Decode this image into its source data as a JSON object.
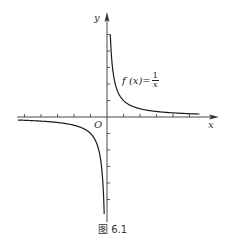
{
  "chart_data": {
    "type": "line",
    "title": "",
    "caption": "图 6.1",
    "function_label": {
      "lhs": "f (x)=",
      "numerator": "1",
      "denominator": "x"
    },
    "xlabel": "x",
    "ylabel": "y",
    "origin_label": "O",
    "xlim": [
      -5.5,
      7.0
    ],
    "ylim": [
      -6.0,
      5.9
    ],
    "grid": false,
    "x_ticks": [
      -5,
      -4,
      -3,
      -2,
      -1,
      1,
      2,
      3,
      4,
      5
    ],
    "y_ticks": [
      -5,
      -4,
      -3,
      -2,
      -1,
      1,
      2,
      3,
      4,
      5
    ],
    "series": [
      {
        "name": "f(x)=1/x (x>0)",
        "x": [
          0.2,
          0.25,
          0.33,
          0.5,
          0.75,
          1,
          1.5,
          2,
          3,
          4,
          5,
          5.6
        ],
        "y": [
          5,
          4,
          3,
          2,
          1.33,
          1,
          0.67,
          0.5,
          0.33,
          0.25,
          0.2,
          0.18
        ]
      },
      {
        "name": "f(x)=1/x (x<0)",
        "x": [
          -5.4,
          -5,
          -4,
          -3,
          -2,
          -1.5,
          -1,
          -0.75,
          -0.5,
          -0.33,
          -0.25,
          -0.2,
          -0.17
        ],
        "y": [
          -0.19,
          -0.2,
          -0.25,
          -0.33,
          -0.5,
          -0.67,
          -1,
          -1.33,
          -2,
          -3,
          -4,
          -5,
          -5.8
        ]
      }
    ],
    "colors": {
      "curve": "#1a1a1a",
      "axes": "#333333"
    }
  }
}
